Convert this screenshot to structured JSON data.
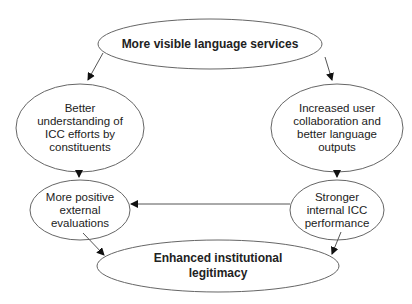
{
  "diagram": {
    "nodes": {
      "top": {
        "label": "More visible language services"
      },
      "left_upper": {
        "label": "Better understanding of ICC efforts by constituents",
        "lines": [
          "Better",
          "understanding of",
          "ICC efforts by",
          "constituents"
        ]
      },
      "right_upper": {
        "label": "Increased user collaboration and better language outputs",
        "lines": [
          "Increased user",
          "collaboration and",
          "better language",
          "outputs"
        ]
      },
      "left_lower": {
        "label": "More positive external evaluations",
        "lines": [
          "More positive",
          "external",
          "evaluations"
        ]
      },
      "right_lower": {
        "label": "Stronger internal ICC performance",
        "lines": [
          "Stronger",
          "internal ICC",
          "performance"
        ]
      },
      "bottom": {
        "label": "Enhanced institutional legitimacy",
        "lines": [
          "Enhanced institutional",
          "legitimacy"
        ]
      }
    },
    "edges": [
      {
        "from": "top",
        "to": "left_upper"
      },
      {
        "from": "top",
        "to": "right_upper"
      },
      {
        "from": "left_upper",
        "to": "left_lower"
      },
      {
        "from": "right_upper",
        "to": "right_lower"
      },
      {
        "from": "right_lower",
        "to": "left_lower"
      },
      {
        "from": "left_lower",
        "to": "bottom"
      },
      {
        "from": "right_lower",
        "to": "bottom"
      }
    ],
    "colors": {
      "stroke": "#555555",
      "arrow": "#111111",
      "text": "#222222"
    }
  }
}
